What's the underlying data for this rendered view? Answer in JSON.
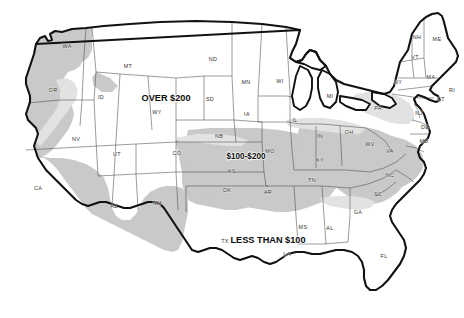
{
  "map": {
    "title": "United States choropleth map",
    "colors": {
      "over_200": "#ffffff",
      "band_100_200": "#e2e2e2",
      "less_than_100": "#c9c9c9",
      "state_border": "#4a4a4a",
      "outer_border": "#111111",
      "label_text": "#33302d"
    },
    "legend": [
      {
        "id": "over-200",
        "label": "OVER $200",
        "x": 166,
        "y": 101,
        "size": "lg"
      },
      {
        "id": "100-200",
        "label": "$100-$200",
        "x": 246,
        "y": 159,
        "size": "md"
      },
      {
        "id": "less-100",
        "label": "LESS THAN $100",
        "x": 268,
        "y": 243,
        "size": "lg"
      }
    ],
    "states": [
      {
        "abbr": "WA",
        "x": 67,
        "y": 48
      },
      {
        "abbr": "OR",
        "x": 53,
        "y": 92
      },
      {
        "abbr": "ID",
        "x": 101,
        "y": 99
      },
      {
        "abbr": "MT",
        "x": 128,
        "y": 68
      },
      {
        "abbr": "ND",
        "x": 213,
        "y": 61
      },
      {
        "abbr": "SD",
        "x": 210,
        "y": 101
      },
      {
        "abbr": "NB",
        "x": 219,
        "y": 138
      },
      {
        "abbr": "MN",
        "x": 246,
        "y": 84
      },
      {
        "abbr": "WI",
        "x": 280,
        "y": 83
      },
      {
        "abbr": "IA",
        "x": 247,
        "y": 116
      },
      {
        "abbr": "NV",
        "x": 76,
        "y": 141
      },
      {
        "abbr": "UT",
        "x": 117,
        "y": 156
      },
      {
        "abbr": "WY",
        "x": 157,
        "y": 114
      },
      {
        "abbr": "CO",
        "x": 177,
        "y": 155
      },
      {
        "abbr": "CA",
        "x": 38,
        "y": 190
      },
      {
        "abbr": "AZ",
        "x": 114,
        "y": 208
      },
      {
        "abbr": "NM",
        "x": 157,
        "y": 205
      },
      {
        "abbr": "KS",
        "x": 232,
        "y": 173
      },
      {
        "abbr": "OK",
        "x": 227,
        "y": 192
      },
      {
        "abbr": "TX",
        "x": 225,
        "y": 243
      },
      {
        "abbr": "MO",
        "x": 270,
        "y": 153
      },
      {
        "abbr": "AR",
        "x": 268,
        "y": 194
      },
      {
        "abbr": "LA",
        "x": 287,
        "y": 256
      },
      {
        "abbr": "MS",
        "x": 303,
        "y": 229
      },
      {
        "abbr": "AL",
        "x": 330,
        "y": 230
      },
      {
        "abbr": "TN",
        "x": 312,
        "y": 182
      },
      {
        "abbr": "KY",
        "x": 320,
        "y": 162
      },
      {
        "abbr": "IL",
        "x": 295,
        "y": 122
      },
      {
        "abbr": "IN",
        "x": 320,
        "y": 138
      },
      {
        "abbr": "OH",
        "x": 349,
        "y": 134
      },
      {
        "abbr": "MI",
        "x": 330,
        "y": 98
      },
      {
        "abbr": "WV",
        "x": 370,
        "y": 146
      },
      {
        "abbr": "VA",
        "x": 390,
        "y": 153
      },
      {
        "abbr": "NC",
        "x": 390,
        "y": 177
      },
      {
        "abbr": "SC",
        "x": 378,
        "y": 196
      },
      {
        "abbr": "GA",
        "x": 358,
        "y": 214
      },
      {
        "abbr": "FL",
        "x": 384,
        "y": 258
      },
      {
        "abbr": "PA",
        "x": 378,
        "y": 110
      },
      {
        "abbr": "NY",
        "x": 398,
        "y": 84
      },
      {
        "abbr": "ME",
        "x": 437,
        "y": 41
      },
      {
        "abbr": "NH",
        "x": 417,
        "y": 39
      },
      {
        "abbr": "VT",
        "x": 415,
        "y": 59
      },
      {
        "abbr": "MA",
        "x": 431,
        "y": 79
      },
      {
        "abbr": "RI",
        "x": 452,
        "y": 92
      },
      {
        "abbr": "CT",
        "x": 441,
        "y": 101
      },
      {
        "abbr": "NJ",
        "x": 419,
        "y": 115
      },
      {
        "abbr": "DE",
        "x": 425,
        "y": 129
      },
      {
        "abbr": "MD",
        "x": 424,
        "y": 143
      }
    ]
  }
}
